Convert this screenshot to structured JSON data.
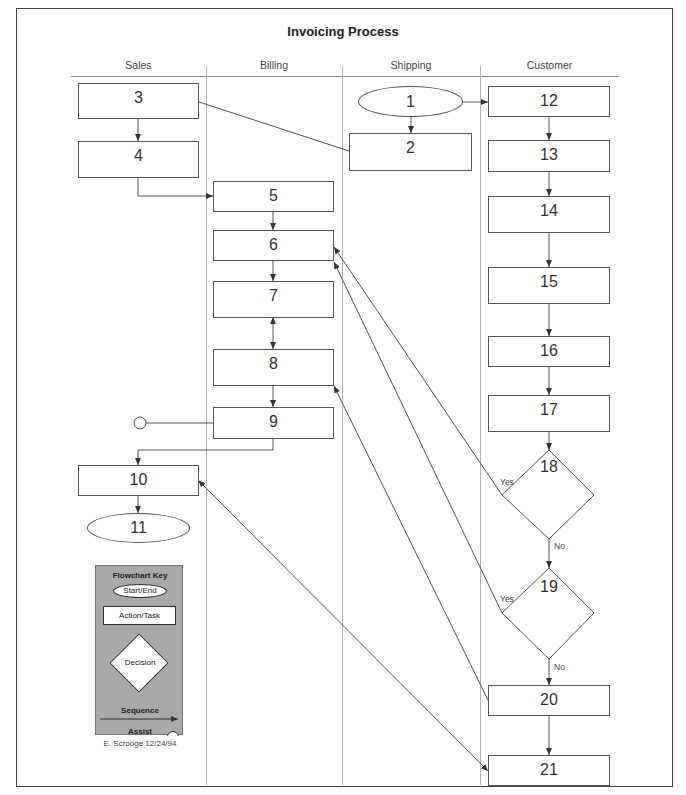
{
  "diagram": {
    "title": "Invoicing Process",
    "lanes": [
      {
        "name": "Sales"
      },
      {
        "name": "Billing"
      },
      {
        "name": "Shipping"
      },
      {
        "name": "Customer"
      }
    ],
    "nodes": {
      "n1": {
        "label": "1",
        "shape": "start-end",
        "lane": "Shipping"
      },
      "n2": {
        "label": "2",
        "shape": "action",
        "lane": "Shipping"
      },
      "n3": {
        "label": "3",
        "shape": "action",
        "lane": "Sales"
      },
      "n4": {
        "label": "4",
        "shape": "action",
        "lane": "Sales"
      },
      "n5": {
        "label": "5",
        "shape": "action",
        "lane": "Billing"
      },
      "n6": {
        "label": "6",
        "shape": "action",
        "lane": "Billing"
      },
      "n7": {
        "label": "7",
        "shape": "action",
        "lane": "Billing"
      },
      "n8": {
        "label": "8",
        "shape": "action",
        "lane": "Billing"
      },
      "n9": {
        "label": "9",
        "shape": "action",
        "lane": "Billing"
      },
      "n10": {
        "label": "10",
        "shape": "action",
        "lane": "Sales"
      },
      "n11": {
        "label": "11",
        "shape": "start-end",
        "lane": "Sales"
      },
      "n12": {
        "label": "12",
        "shape": "action",
        "lane": "Customer"
      },
      "n13": {
        "label": "13",
        "shape": "action",
        "lane": "Customer"
      },
      "n14": {
        "label": "14",
        "shape": "action",
        "lane": "Customer"
      },
      "n15": {
        "label": "15",
        "shape": "action",
        "lane": "Customer"
      },
      "n16": {
        "label": "16",
        "shape": "action",
        "lane": "Customer"
      },
      "n17": {
        "label": "17",
        "shape": "action",
        "lane": "Customer"
      },
      "n18": {
        "label": "18",
        "shape": "decision",
        "lane": "Customer"
      },
      "n19": {
        "label": "19",
        "shape": "decision",
        "lane": "Customer"
      },
      "n20": {
        "label": "20",
        "shape": "action",
        "lane": "Customer"
      },
      "n21": {
        "label": "21",
        "shape": "action",
        "lane": "Customer"
      }
    },
    "branch_labels": {
      "d18_yes": "Yes",
      "d18_no": "No",
      "d19_yes": "Yes",
      "d19_no": "No"
    },
    "edges": [
      {
        "from": "1",
        "to": "2",
        "type": "sequence"
      },
      {
        "from": "1",
        "to": "12",
        "type": "sequence"
      },
      {
        "from": "3",
        "to": "4",
        "type": "sequence"
      },
      {
        "from": "3",
        "to": "2",
        "type": "assist-line"
      },
      {
        "from": "4",
        "to": "5",
        "type": "sequence"
      },
      {
        "from": "5",
        "to": "6",
        "type": "sequence"
      },
      {
        "from": "6",
        "to": "7",
        "type": "sequence"
      },
      {
        "from": "7",
        "to": "8",
        "type": "bidirectional"
      },
      {
        "from": "8",
        "to": "9",
        "type": "sequence"
      },
      {
        "from": "9",
        "to": "10",
        "type": "sequence"
      },
      {
        "from": "9",
        "to": "assist-circle",
        "type": "assist"
      },
      {
        "from": "10",
        "to": "11",
        "type": "sequence"
      },
      {
        "from": "12",
        "to": "13",
        "type": "sequence"
      },
      {
        "from": "13",
        "to": "14",
        "type": "sequence"
      },
      {
        "from": "14",
        "to": "15",
        "type": "sequence"
      },
      {
        "from": "15",
        "to": "16",
        "type": "sequence"
      },
      {
        "from": "16",
        "to": "17",
        "type": "sequence"
      },
      {
        "from": "17",
        "to": "18",
        "type": "sequence"
      },
      {
        "from": "18",
        "to": "6",
        "type": "sequence",
        "label": "Yes"
      },
      {
        "from": "18",
        "to": "19",
        "type": "sequence",
        "label": "No"
      },
      {
        "from": "19",
        "to": "6",
        "type": "sequence",
        "label": "Yes"
      },
      {
        "from": "19",
        "to": "20",
        "type": "sequence",
        "label": "No"
      },
      {
        "from": "20",
        "to": "8",
        "type": "sequence"
      },
      {
        "from": "20",
        "to": "21",
        "type": "sequence"
      },
      {
        "from": "10",
        "to": "21",
        "type": "bidirectional"
      }
    ]
  },
  "key": {
    "title": "Flowchart Key",
    "start_end": "Start/End",
    "action_task": "Action/Task",
    "decision": "Decision",
    "sequence": "Sequence",
    "assist": "Assist"
  },
  "author": "E. Scrooge 12/24/94",
  "colors": {
    "line": "#555555",
    "lane_divider": "#b5b5b5",
    "key_background": "#a9a9a9"
  }
}
